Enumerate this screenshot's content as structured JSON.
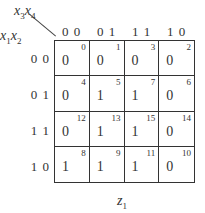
{
  "kmap": {
    "row_vars": "x1x2",
    "col_vars": "x3x4",
    "col_labels": [
      "0 0",
      "0 1",
      "1 1",
      "1 0"
    ],
    "row_labels": [
      "0 0",
      "0 1",
      "1 1",
      "1 0"
    ],
    "cells": [
      [
        {
          "v": "0",
          "i": "0"
        },
        {
          "v": "0",
          "i": "1"
        },
        {
          "v": "0",
          "i": "3"
        },
        {
          "v": "0",
          "i": "2"
        }
      ],
      [
        {
          "v": "0",
          "i": "4"
        },
        {
          "v": "1",
          "i": "5"
        },
        {
          "v": "1",
          "i": "7"
        },
        {
          "v": "0",
          "i": "6"
        }
      ],
      [
        {
          "v": "0",
          "i": "12"
        },
        {
          "v": "1",
          "i": "13"
        },
        {
          "v": "1",
          "i": "15"
        },
        {
          "v": "0",
          "i": "14"
        }
      ],
      [
        {
          "v": "1",
          "i": "8"
        },
        {
          "v": "1",
          "i": "9"
        },
        {
          "v": "1",
          "i": "11"
        },
        {
          "v": "0",
          "i": "10"
        }
      ]
    ],
    "function_name": "z",
    "function_sub": "1",
    "row_var_a": "x",
    "row_sub_a": "1",
    "row_var_b": "x",
    "row_sub_b": "2",
    "col_var_a": "x",
    "col_sub_a": "3",
    "col_var_b": "x",
    "col_sub_b": "4"
  }
}
